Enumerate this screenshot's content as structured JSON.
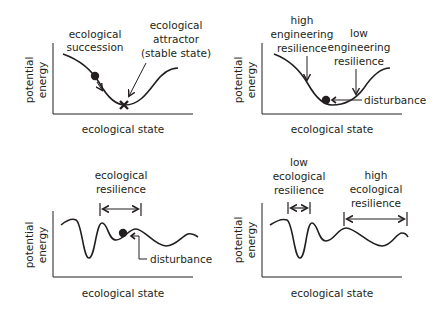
{
  "panels": [
    {
      "id": "panel-1",
      "ylabel_line1": "potential",
      "ylabel_line2": "energy",
      "xlabel": "ecological state",
      "annotations": {
        "succession_line1": "ecological",
        "succession_line2": "succession",
        "attractor_line1": "ecological",
        "attractor_line2": "attractor",
        "attractor_line3": "(stable state)"
      }
    },
    {
      "id": "panel-2",
      "ylabel_line1": "potential",
      "ylabel_line2": "energy",
      "xlabel": "ecological state",
      "annotations": {
        "high_line1": "high",
        "high_line2": "engineering",
        "high_line3": "resilience",
        "low_line1": "low",
        "low_line2": "engineering",
        "low_line3": "resilience",
        "disturbance": "disturbance"
      }
    },
    {
      "id": "panel-3",
      "ylabel_line1": "potential",
      "ylabel_line2": "energy",
      "xlabel": "ecological state",
      "annotations": {
        "resilience_line1": "ecological",
        "resilience_line2": "resilience",
        "disturbance": "disturbance"
      }
    },
    {
      "id": "panel-4",
      "ylabel_line1": "potential",
      "ylabel_line2": "energy",
      "xlabel": "ecological state",
      "annotations": {
        "low_line1": "low",
        "low_line2": "ecological",
        "low_line3": "resilience",
        "high_line1": "high",
        "high_line2": "ecological",
        "high_line3": "resilience"
      }
    }
  ],
  "colors": {
    "ink": "#231f20",
    "background": "#ffffff"
  }
}
